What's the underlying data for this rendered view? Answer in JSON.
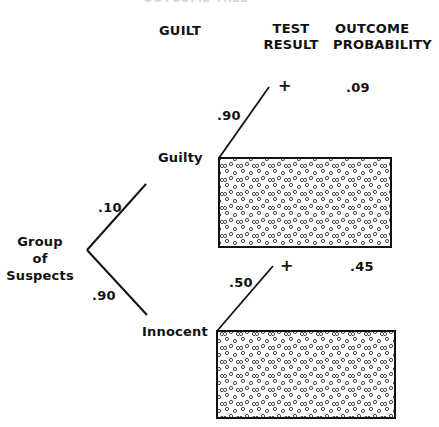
{
  "header": {
    "cutoff_text": "OUTCOME TREE",
    "columns": [
      {
        "id": "guilt",
        "label": "GUILT"
      },
      {
        "id": "test_result",
        "label_line1": "TEST",
        "label_line2": "RESULT"
      },
      {
        "id": "outcome_probability",
        "label_line1": "OUTCOME",
        "label_line2": "PROBABILITY"
      }
    ]
  },
  "tree": {
    "root": {
      "label_line1": "Group",
      "label_line2": "of",
      "label_line3": "Suspects"
    },
    "branches": [
      {
        "id": "guilty",
        "label": "Guilty",
        "probability": ".10",
        "test": {
          "result": "+",
          "probability": ".90",
          "outcome_probability": ".09"
        }
      },
      {
        "id": "innocent",
        "label": "Innocent",
        "probability": ".90",
        "test": {
          "result": "+",
          "probability": ".50",
          "outcome_probability": ".45"
        }
      }
    ]
  },
  "style": {
    "ink_color": "#111111",
    "background": "#ffffff"
  }
}
